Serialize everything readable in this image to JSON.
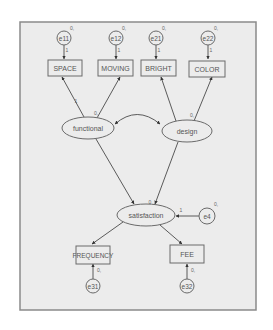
{
  "diagram": {
    "type": "structural equation model path diagram",
    "observed": [
      {
        "id": "SPACE",
        "label": "SPACE"
      },
      {
        "id": "MOVING",
        "label": "MOVING"
      },
      {
        "id": "BRIGHT",
        "label": "BRIGHT"
      },
      {
        "id": "COLOR",
        "label": "COLOR"
      },
      {
        "id": "FREQUENCY",
        "label": "FREQUENCY"
      },
      {
        "id": "FEE",
        "label": "FEE"
      }
    ],
    "latent": [
      {
        "id": "functional",
        "label": "functional"
      },
      {
        "id": "design",
        "label": "design"
      },
      {
        "id": "satisfaction",
        "label": "satisfaction"
      }
    ],
    "errors": [
      {
        "id": "e11",
        "label": "e11",
        "variance_label": "0,",
        "path_label": "1"
      },
      {
        "id": "e12",
        "label": "e12",
        "variance_label": "0,",
        "path_label": "1"
      },
      {
        "id": "e21",
        "label": "e21",
        "variance_label": "0,",
        "path_label": "1"
      },
      {
        "id": "e22",
        "label": "e22",
        "variance_label": "0,",
        "path_label": "1"
      },
      {
        "id": "e4",
        "label": "e4",
        "variance_label": "0,",
        "path_label": "1"
      },
      {
        "id": "e31",
        "label": "e31",
        "variance_label": "",
        "path_label": "0,"
      },
      {
        "id": "e32",
        "label": "e32",
        "variance_label": "",
        "path_label": "0,"
      }
    ],
    "latent_labels": {
      "functional": "0,",
      "design": "0,",
      "satisfaction": "0"
    },
    "fixed_paths": {
      "functional_to_SPACE": "1"
    },
    "edges": [
      {
        "from": "e11",
        "to": "SPACE"
      },
      {
        "from": "e12",
        "to": "MOVING"
      },
      {
        "from": "e21",
        "to": "BRIGHT"
      },
      {
        "from": "e22",
        "to": "COLOR"
      },
      {
        "from": "functional",
        "to": "SPACE"
      },
      {
        "from": "functional",
        "to": "MOVING"
      },
      {
        "from": "design",
        "to": "BRIGHT"
      },
      {
        "from": "design",
        "to": "COLOR"
      },
      {
        "from": "functional",
        "to": "design",
        "type": "covariance"
      },
      {
        "from": "functional",
        "to": "satisfaction"
      },
      {
        "from": "design",
        "to": "satisfaction"
      },
      {
        "from": "e4",
        "to": "satisfaction"
      },
      {
        "from": "satisfaction",
        "to": "FREQUENCY"
      },
      {
        "from": "satisfaction",
        "to": "FEE"
      },
      {
        "from": "e31",
        "to": "FREQUENCY"
      },
      {
        "from": "e32",
        "to": "FEE"
      }
    ]
  }
}
